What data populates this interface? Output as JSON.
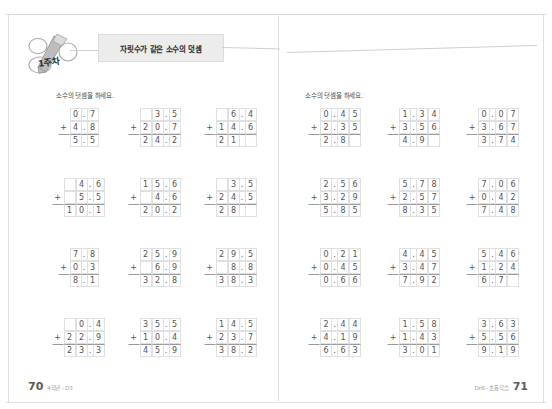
{
  "header": {
    "week_label": "1주차",
    "title": "자릿수가 같은 소수의 덧셈"
  },
  "left_page": {
    "instruction": "소수의 덧셈을 하세요.",
    "folio": "70",
    "footer_note": "4학년 - D3",
    "problems": [
      {
        "addend1": "0.7",
        "addend2": "4.8",
        "sum": "5.5",
        "sign": "+",
        "width": 2
      },
      {
        "addend1": "3.5",
        "addend2": "20.7",
        "sum": "24.2",
        "sign": "+",
        "width": 3
      },
      {
        "addend1": "6.4",
        "addend2": "14.6",
        "sum": "21",
        "sign": "+",
        "width": 3
      },
      {
        "addend1": "4.6",
        "addend2": "5.5",
        "sum": "10.1",
        "sign": "+",
        "width": 3
      },
      {
        "addend1": "15.6",
        "addend2": "4.6",
        "sum": "20.2",
        "sign": "+",
        "width": 3
      },
      {
        "addend1": "3.5",
        "addend2": "24.5",
        "sum": "28",
        "sign": "+",
        "width": 3
      },
      {
        "addend1": "7.8",
        "addend2": "0.3",
        "sum": "8.1",
        "sign": "+",
        "width": 2
      },
      {
        "addend1": "25.9",
        "addend2": "6.9",
        "sum": "32.8",
        "sign": "+",
        "width": 3
      },
      {
        "addend1": "29.5",
        "addend2": "8.8",
        "sum": "38.3",
        "sign": "+",
        "width": 3
      },
      {
        "addend1": "0.4",
        "addend2": "22.9",
        "sum": "23.3",
        "sign": "+",
        "width": 3
      },
      {
        "addend1": "35.5",
        "addend2": "10.4",
        "sum": "45.9",
        "sign": "+",
        "width": 3
      },
      {
        "addend1": "14.5",
        "addend2": "23.7",
        "sum": "38.2",
        "sign": "+",
        "width": 3
      }
    ]
  },
  "right_page": {
    "instruction": "소수의 덧셈을 하세요.",
    "folio": "71",
    "footer_note": "Drill - 초등학습",
    "problems": [
      {
        "addend1": "0.45",
        "addend2": "2.35",
        "sum": "2.8",
        "sign": "+",
        "width": 3
      },
      {
        "addend1": "1.34",
        "addend2": "3.56",
        "sum": "4.9",
        "sign": "+",
        "width": 3
      },
      {
        "addend1": "0.07",
        "addend2": "3.67",
        "sum": "3.74",
        "sign": "+",
        "width": 3
      },
      {
        "addend1": "2.56",
        "addend2": "3.29",
        "sum": "5.85",
        "sign": "+",
        "width": 3
      },
      {
        "addend1": "5.78",
        "addend2": "2.57",
        "sum": "8.35",
        "sign": "+",
        "width": 3
      },
      {
        "addend1": "7.06",
        "addend2": "0.42",
        "sum": "7.48",
        "sign": "+",
        "width": 3
      },
      {
        "addend1": "0.21",
        "addend2": "0.45",
        "sum": "0.66",
        "sign": "+",
        "width": 3
      },
      {
        "addend1": "4.45",
        "addend2": "3.47",
        "sum": "7.92",
        "sign": "+",
        "width": 3
      },
      {
        "addend1": "5.46",
        "addend2": "1.24",
        "sum": "6.7",
        "sign": "+",
        "width": 3
      },
      {
        "addend1": "2.44",
        "addend2": "4.19",
        "sum": "6.63",
        "sign": "+",
        "width": 3
      },
      {
        "addend1": "1.58",
        "addend2": "1.43",
        "sum": "3.01",
        "sign": "+",
        "width": 3
      },
      {
        "addend1": "3.63",
        "addend2": "5.56",
        "sum": "9.19",
        "sign": "+",
        "width": 3
      }
    ]
  }
}
